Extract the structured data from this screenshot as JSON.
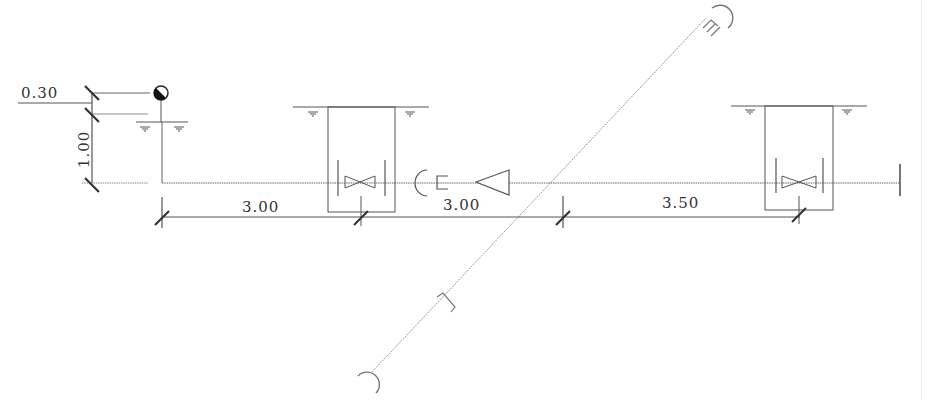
{
  "diagram": {
    "type": "pipeline section drawing",
    "colors": {
      "line": "#555555",
      "thin_line": "#8a8a8a",
      "dim_line": "#333333",
      "background": "#ffffff"
    },
    "vertical_dimensions": [
      {
        "label": "0.30",
        "orientation": "horizontal-text"
      },
      {
        "label": "1.00",
        "orientation": "vertical-text"
      }
    ],
    "horizontal_dimensions": [
      {
        "label": "3.00",
        "segment": "start-to-chamber-1"
      },
      {
        "label": "3.00",
        "segment": "chamber-1-to-crossing"
      },
      {
        "label": "3.50",
        "segment": "crossing-to-chamber-2"
      }
    ],
    "symbols": [
      {
        "name": "half-filled-circle",
        "meaning": "elevation/level marker"
      },
      {
        "name": "water-level-marker",
        "count": 6
      },
      {
        "name": "valve-chamber",
        "count": 2
      },
      {
        "name": "gate-valve",
        "count": 2
      },
      {
        "name": "reducer-triangle",
        "count": 1
      },
      {
        "name": "socket-plug-end",
        "count": 1
      },
      {
        "name": "pipe-cap-end",
        "count": 1
      },
      {
        "name": "diagonal-crossing-pipe",
        "count": 1
      }
    ]
  }
}
